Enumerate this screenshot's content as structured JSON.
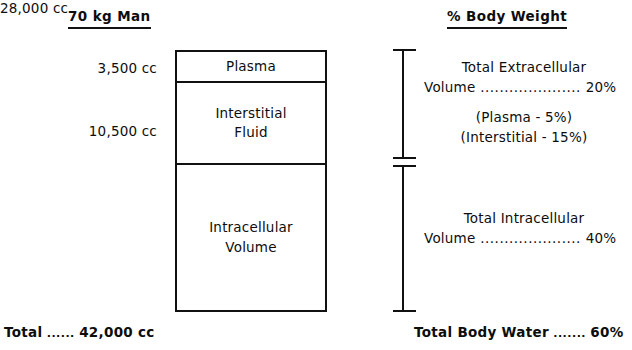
{
  "diagram": {
    "headings": {
      "left": "70 kg Man",
      "right": "% Body Weight"
    },
    "volume_labels": {
      "plasma": "3,500 cc",
      "interstitial": "10,500 cc",
      "intracellular": "28,000 cc"
    },
    "compartments": {
      "plasma": {
        "label": "Plasma"
      },
      "interstitial": {
        "line1": "Interstitial",
        "line2": "Fluid"
      },
      "intracellular": {
        "line1": "Intracellular",
        "line2": "Volume"
      }
    },
    "descriptions": {
      "extracellular": {
        "line1": "Total Extracellular",
        "line2_prefix": "Volume",
        "leader": " ..................... ",
        "value": "20%"
      },
      "parenthetical": {
        "plasma": "(Plasma - 5%)",
        "interstitial": "(Interstitial - 15%)"
      },
      "intracellular": {
        "line1": "Total Intracellular",
        "line2_prefix": "Volume",
        "leader": " ..................... ",
        "value": "40%"
      }
    },
    "totals": {
      "left_prefix": "Total",
      "left_leader": " ...... ",
      "left_value": "42,000 cc",
      "right_prefix": "Total Body Water",
      "right_leader": " ....... ",
      "right_value": "60%"
    }
  },
  "chart_data": {
    "type": "bar",
    "categories": [
      "Plasma",
      "Interstitial Fluid",
      "Intracellular Volume"
    ],
    "values": [
      3500,
      10500,
      28000
    ],
    "value_labels": [
      "3,500 cc",
      "10,500 cc",
      "28,000 cc"
    ],
    "percent_body_weight": [
      5,
      15,
      40
    ],
    "grouped": [
      {
        "name": "Total Extracellular Volume",
        "members": [
          "Plasma",
          "Interstitial Fluid"
        ],
        "volume_cc": 14000,
        "percent_body_weight": 20
      },
      {
        "name": "Total Intracellular Volume",
        "members": [
          "Intracellular Volume"
        ],
        "volume_cc": 28000,
        "percent_body_weight": 40
      }
    ],
    "total_volume_cc": 42000,
    "total_body_water_percent": 60,
    "xlabel": "",
    "ylabel": "Volume (cc)",
    "orientation": "vertical-stacked",
    "grid": false,
    "legend": false
  }
}
